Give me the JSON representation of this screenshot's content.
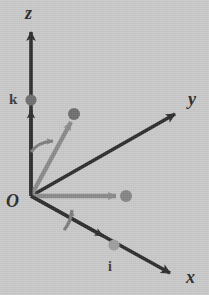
{
  "figure": {
    "background_color": "#c9c9c9",
    "width": 209,
    "height": 295
  },
  "colors": {
    "axis": "#2d2d2d",
    "dark_text": "#2a2a2a",
    "vector_mid_gray": "#8a8a8a",
    "vector_light_gray": "#9b9b9b",
    "dot_dark": "#6e6e6e",
    "dot_mid": "#858585",
    "dot_light": "#9e9e9e",
    "arc_gray": "#7d7d7d"
  },
  "axes": [
    {
      "name": "z-axis",
      "label": "z",
      "origin": [
        31,
        196
      ],
      "tip": [
        31,
        25
      ],
      "direction": "up"
    },
    {
      "name": "y-axis",
      "label": "y",
      "origin": [
        31,
        196
      ],
      "tip": [
        182,
        110
      ],
      "direction": "upper-right"
    },
    {
      "name": "x-axis",
      "label": "x",
      "origin": [
        31,
        196
      ],
      "tip": [
        177,
        278
      ],
      "direction": "lower-right"
    }
  ],
  "origin": {
    "label": "O",
    "point": [
      31,
      196
    ]
  },
  "vectors": [
    {
      "name": "k-unit-vector",
      "label": "k",
      "from": [
        31,
        196
      ],
      "to": [
        31,
        101
      ],
      "color": "#2d2d2d",
      "endpoint_dot": true,
      "dot_color": "#6e6e6e",
      "description": "unit vector along z-axis"
    },
    {
      "name": "resultant-vector",
      "label": "",
      "from": [
        31,
        196
      ],
      "to": [
        74,
        116
      ],
      "color": "#8a8a8a",
      "endpoint_dot": true,
      "dot_color": "#6e6e6e",
      "description": "gray vector into upper region"
    },
    {
      "name": "j-projection-vector",
      "label": "",
      "from": [
        31,
        196
      ],
      "to": [
        124,
        196
      ],
      "color": "#8a8a8a",
      "endpoint_dot": true,
      "dot_color": "#858585",
      "description": "horizontal gray projection vector"
    },
    {
      "name": "i-unit-vector",
      "label": "i",
      "from": [
        31,
        196
      ],
      "to": [
        113,
        246
      ],
      "color": "#2d2d2d",
      "endpoint_dot": true,
      "dot_color": "#9e9e9e",
      "description": "unit vector along x-axis"
    }
  ],
  "arcs": [
    {
      "name": "angle-arc-upper",
      "from_axis": "z-axis",
      "to_vector": "resultant-vector",
      "color": "#7d7d7d"
    },
    {
      "name": "angle-arc-lower",
      "from_axis": "x-axis",
      "to_vector": "j-projection-vector",
      "color": "#7d7d7d"
    }
  ],
  "labels": {
    "z": "z",
    "y": "y",
    "x": "x",
    "O": "O",
    "k": "k",
    "i": "i"
  }
}
